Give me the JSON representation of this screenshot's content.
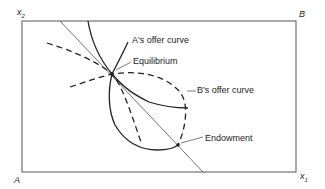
{
  "diagram": {
    "type": "edgeworth-box",
    "axes": {
      "x_label": "x",
      "x_sub": "1",
      "y_label": "x",
      "y_sub": "2",
      "origin_A": "A",
      "origin_B": "B"
    },
    "labels": {
      "a_offer": "A's offer curve",
      "equilibrium": "Equilibrium",
      "b_offer": "B's offer curve",
      "endowment": "Endowment"
    },
    "colors": {
      "ink": "#222222",
      "background": "#ffffff"
    }
  }
}
